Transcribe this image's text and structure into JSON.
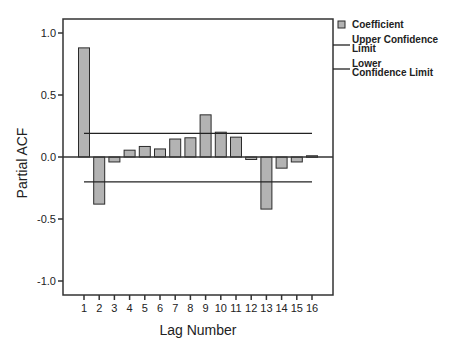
{
  "chart_data": {
    "type": "bar",
    "title": "",
    "xlabel": "Lag Number",
    "ylabel": "Partial ACF",
    "ylim": [
      -1.1,
      1.1
    ],
    "yticks": [
      "1.0",
      "0.5",
      "0.0",
      "-0.5",
      "-1.0"
    ],
    "ytick_values": [
      1.0,
      0.5,
      0.0,
      -0.5,
      -1.0
    ],
    "categories": [
      "1",
      "2",
      "3",
      "4",
      "5",
      "6",
      "7",
      "8",
      "9",
      "10",
      "11",
      "12",
      "13",
      "14",
      "15",
      "16"
    ],
    "series": [
      {
        "name": "Coefficient",
        "values": [
          0.88,
          -0.38,
          -0.04,
          0.055,
          0.085,
          0.065,
          0.145,
          0.155,
          0.34,
          0.2,
          0.16,
          -0.02,
          -0.42,
          -0.09,
          -0.04,
          0.01
        ]
      }
    ],
    "upper_confidence_limit": 0.19,
    "lower_confidence_limit": -0.2,
    "grid": false,
    "legend_position": "right",
    "legend": [
      {
        "label": "Coefficient",
        "kind": "bar-swatch"
      },
      {
        "label_lines": [
          "Upper Confidence",
          "Limit"
        ],
        "kind": "line"
      },
      {
        "label_lines": [
          "Lower",
          "Confidence Limit"
        ],
        "kind": "line"
      }
    ],
    "colors": {
      "bar_fill": "#b3b3b3",
      "bar_stroke": "#2b2b2b",
      "axis": "#333333",
      "confidence_line": "#222222"
    }
  }
}
